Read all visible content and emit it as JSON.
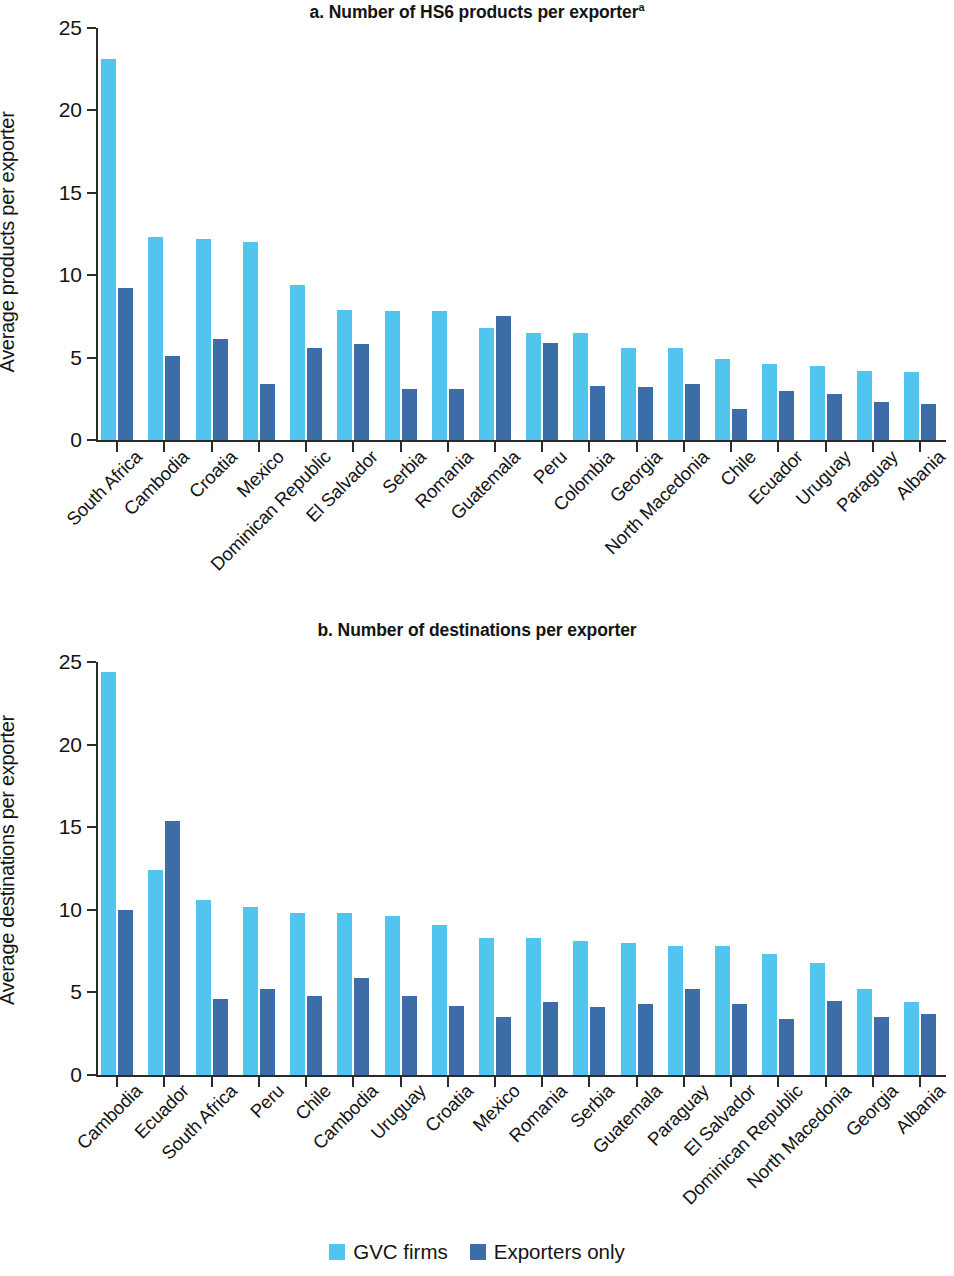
{
  "legend": {
    "items": [
      {
        "label": "GVC firms",
        "color": "#52c5ee",
        "key": "gvc"
      },
      {
        "label": "Exporters only",
        "color": "#3d6da6",
        "key": "only"
      }
    ]
  },
  "colors": {
    "gvc_firms": "#52c5ee",
    "exporters_only": "#3d6da6",
    "axis": "#2b2b2b",
    "text": "#141414",
    "background": "#ffffff"
  },
  "chart_data": [
    {
      "id": "panel-a",
      "type": "bar",
      "title": "a. Number of HS6 products per exporter",
      "title_superscript": "a",
      "xlabel": "",
      "ylabel": "Average products per exporter",
      "ylim": [
        0,
        25
      ],
      "yticks": [
        0,
        5,
        10,
        15,
        20,
        25
      ],
      "grid": false,
      "legend_position": "bottom",
      "categories": [
        "South Africa",
        "Cambodia",
        "Croatia",
        "Mexico",
        "Dominican Republic",
        "El Salvador",
        "Serbia",
        "Romania",
        "Guatemala",
        "Peru",
        "Colombia",
        "Georgia",
        "North Macedonia",
        "Chile",
        "Ecuador",
        "Uruguay",
        "Paraguay",
        "Albania"
      ],
      "series": [
        {
          "name": "GVC firms",
          "color": "#52c5ee",
          "values": [
            23.1,
            12.3,
            12.2,
            12.0,
            9.4,
            7.9,
            7.8,
            7.8,
            6.8,
            6.5,
            6.5,
            5.6,
            5.6,
            4.9,
            4.6,
            4.5,
            4.2,
            4.1
          ]
        },
        {
          "name": "Exporters only",
          "color": "#3d6da6",
          "values": [
            9.2,
            5.1,
            6.1,
            3.4,
            5.6,
            5.8,
            3.1,
            3.1,
            7.5,
            5.9,
            3.3,
            3.2,
            3.4,
            1.9,
            3.0,
            2.8,
            2.3,
            2.2
          ]
        }
      ]
    },
    {
      "id": "panel-b",
      "type": "bar",
      "title": "b. Number of destinations per exporter",
      "title_superscript": "",
      "xlabel": "",
      "ylabel": "Average destinations per exporter",
      "ylim": [
        0,
        25
      ],
      "yticks": [
        0,
        5,
        10,
        15,
        20,
        25
      ],
      "grid": false,
      "legend_position": "bottom",
      "categories": [
        "Cambodia",
        "Ecuador",
        "South Africa",
        "Peru",
        "Chile",
        "Cambodia",
        "Uruguay",
        "Croatia",
        "Mexico",
        "Romania",
        "Serbia",
        "Guatemala",
        "Paraguay",
        "El Salvador",
        "Dominican Republic",
        "North Macedonia",
        "Georgia",
        "Albania"
      ],
      "series": [
        {
          "name": "GVC firms",
          "color": "#52c5ee",
          "values": [
            24.4,
            12.4,
            10.6,
            10.2,
            9.8,
            9.8,
            9.6,
            9.1,
            8.3,
            8.3,
            8.1,
            8.0,
            7.8,
            7.8,
            7.3,
            6.8,
            5.2,
            4.4
          ]
        },
        {
          "name": "Exporters only",
          "color": "#3d6da6",
          "values": [
            10.0,
            15.4,
            4.6,
            5.2,
            4.8,
            5.9,
            4.8,
            4.2,
            3.5,
            4.4,
            4.1,
            4.3,
            5.2,
            4.3,
            3.4,
            4.5,
            3.5,
            3.7
          ]
        }
      ]
    }
  ]
}
